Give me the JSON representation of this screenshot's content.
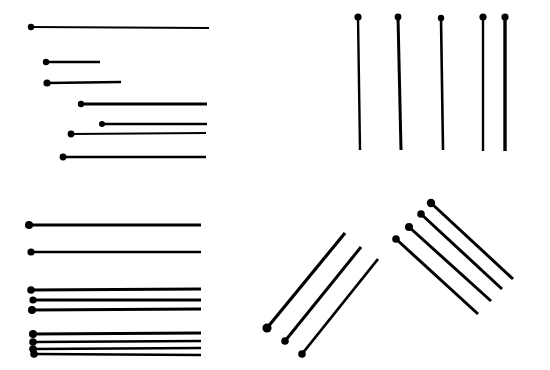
{
  "figure": {
    "width": 550,
    "height": 370,
    "background": "#ffffff",
    "ink": "#000000",
    "panels": [
      {
        "id": "top-left",
        "description": "horizontal pins with varying start and end points",
        "pins": [
          {
            "x1": 31,
            "y1": 27,
            "x2": 209,
            "y2": 28,
            "r": 3.2,
            "w": 2.2
          },
          {
            "x1": 46,
            "y1": 62,
            "x2": 100,
            "y2": 62,
            "r": 3.2,
            "w": 2.6
          },
          {
            "x1": 47,
            "y1": 83,
            "x2": 121,
            "y2": 82,
            "r": 3.6,
            "w": 2.6
          },
          {
            "x1": 81,
            "y1": 104,
            "x2": 207,
            "y2": 104,
            "r": 3.2,
            "w": 2.8
          },
          {
            "x1": 102,
            "y1": 124,
            "x2": 207,
            "y2": 124,
            "r": 3.0,
            "w": 2.6
          },
          {
            "x1": 71,
            "y1": 134,
            "x2": 206,
            "y2": 133,
            "r": 3.4,
            "w": 2.2
          },
          {
            "x1": 63,
            "y1": 157,
            "x2": 206,
            "y2": 157,
            "r": 3.4,
            "w": 2.4
          }
        ]
      },
      {
        "id": "top-right",
        "description": "vertical pins",
        "pins": [
          {
            "x1": 358,
            "y1": 17,
            "x2": 360,
            "y2": 150,
            "r": 3.6,
            "w": 2.4
          },
          {
            "x1": 398,
            "y1": 17,
            "x2": 401,
            "y2": 150,
            "r": 3.4,
            "w": 3.0
          },
          {
            "x1": 441,
            "y1": 18,
            "x2": 443,
            "y2": 150,
            "r": 3.2,
            "w": 2.6
          },
          {
            "x1": 483,
            "y1": 17,
            "x2": 483,
            "y2": 151,
            "r": 3.6,
            "w": 2.4
          },
          {
            "x1": 505,
            "y1": 17,
            "x2": 505,
            "y2": 151,
            "r": 3.6,
            "w": 3.4
          }
        ]
      },
      {
        "id": "bottom-left",
        "description": "horizontal pins aligned at left, grouped",
        "pins": [
          {
            "x1": 29,
            "y1": 225,
            "x2": 201,
            "y2": 225,
            "r": 4.0,
            "w": 2.8
          },
          {
            "x1": 31,
            "y1": 252,
            "x2": 201,
            "y2": 252,
            "r": 3.6,
            "w": 2.6
          },
          {
            "x1": 31,
            "y1": 290,
            "x2": 201,
            "y2": 289,
            "r": 3.8,
            "w": 2.8
          },
          {
            "x1": 33,
            "y1": 300,
            "x2": 201,
            "y2": 300,
            "r": 3.6,
            "w": 2.8
          },
          {
            "x1": 32,
            "y1": 310,
            "x2": 201,
            "y2": 309,
            "r": 4.0,
            "w": 2.8
          },
          {
            "x1": 33,
            "y1": 334,
            "x2": 201,
            "y2": 333,
            "r": 4.0,
            "w": 2.8
          },
          {
            "x1": 33,
            "y1": 342,
            "x2": 201,
            "y2": 341,
            "r": 3.8,
            "w": 2.6
          },
          {
            "x1": 33,
            "y1": 349,
            "x2": 201,
            "y2": 348,
            "r": 3.8,
            "w": 2.4
          },
          {
            "x1": 34,
            "y1": 354,
            "x2": 201,
            "y2": 355,
            "r": 3.8,
            "w": 2.4
          }
        ]
      },
      {
        "id": "bottom-middle",
        "description": "diagonal pins rising to the right",
        "pins": [
          {
            "x1": 267,
            "y1": 328,
            "x2": 345,
            "y2": 233,
            "r": 4.6,
            "w": 3.2
          },
          {
            "x1": 285,
            "y1": 341,
            "x2": 361,
            "y2": 247,
            "r": 3.8,
            "w": 3.0
          },
          {
            "x1": 302,
            "y1": 354,
            "x2": 378,
            "y2": 259,
            "r": 3.8,
            "w": 2.8
          }
        ]
      },
      {
        "id": "bottom-right",
        "description": "diagonal pins descending to the right",
        "pins": [
          {
            "x1": 431,
            "y1": 203,
            "x2": 513,
            "y2": 279,
            "r": 4.2,
            "w": 3.0
          },
          {
            "x1": 421,
            "y1": 214,
            "x2": 502,
            "y2": 289,
            "r": 3.8,
            "w": 3.0
          },
          {
            "x1": 409,
            "y1": 227,
            "x2": 491,
            "y2": 301,
            "r": 4.0,
            "w": 3.0
          },
          {
            "x1": 396,
            "y1": 239,
            "x2": 478,
            "y2": 314,
            "r": 3.8,
            "w": 3.0
          }
        ]
      }
    ]
  }
}
